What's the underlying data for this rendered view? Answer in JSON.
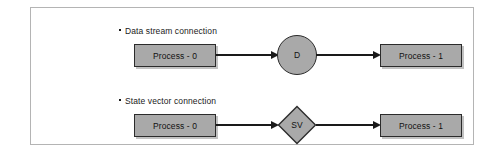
{
  "figure": {
    "background_color": "#ffffff",
    "frame_border_color": "#b4b4b4",
    "node_fill_color": "#a9a9a9",
    "node_stroke_color": "#2b2b2b",
    "connector_color": "#1a1a1a",
    "text_color": "#111111"
  },
  "rows": [
    {
      "caption": "Data stream connection",
      "source_label": "Process - 0",
      "node_label": "D",
      "node_shape": "circle",
      "target_label": "Process - 1"
    },
    {
      "caption": "State vector connection",
      "source_label": "Process - 0",
      "node_label": "SV",
      "node_shape": "diamond",
      "target_label": "Process - 1"
    }
  ]
}
